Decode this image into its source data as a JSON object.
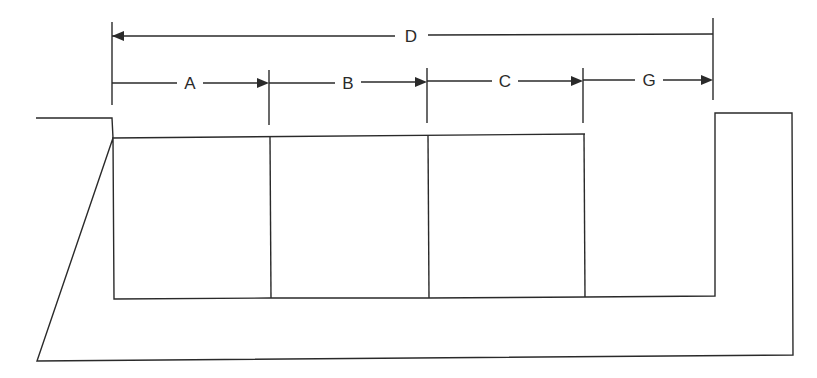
{
  "diagram": {
    "type": "dimension-drawing",
    "labels": {
      "overall": "D",
      "segment_a": "A",
      "segment_b": "B",
      "segment_c": "C",
      "segment_g": "G"
    },
    "dimensions": [
      {
        "label": "A",
        "from": "left-edge",
        "to": "box-1-right"
      },
      {
        "label": "B",
        "from": "box-1-right",
        "to": "box-2-right"
      },
      {
        "label": "C",
        "from": "box-2-right",
        "to": "box-3-right"
      },
      {
        "label": "G",
        "from": "box-3-right",
        "to": "right-post-inner"
      },
      {
        "label": "D",
        "from": "left-edge",
        "to": "right-post-inner"
      }
    ],
    "components": [
      "u-shaped-channel",
      "box-1",
      "box-2",
      "box-3",
      "gap-g"
    ],
    "line_color": "#2a2a2a",
    "background": "#ffffff"
  }
}
